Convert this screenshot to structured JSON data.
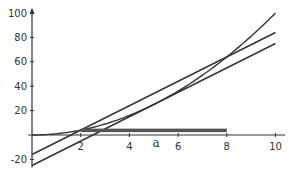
{
  "chart_data": {
    "type": "line",
    "title": "",
    "xlabel": "",
    "ylabel": "",
    "xlim": [
      0,
      10.4
    ],
    "ylim": [
      -25,
      100
    ],
    "grid": false,
    "x_ticks": [
      "2",
      "4",
      "6",
      "8",
      "10"
    ],
    "y_ticks": [
      "100",
      "80",
      "60",
      "40",
      "20",
      "-20"
    ],
    "annotations": [
      {
        "text": "a",
        "x": 5.1,
        "y": -5
      }
    ],
    "series": [
      {
        "name": "curve",
        "x": [
          0,
          1,
          2,
          3,
          4,
          5,
          6,
          7,
          8,
          9,
          10
        ],
        "values": [
          0,
          1,
          4,
          9,
          16,
          25,
          36,
          49,
          64,
          81,
          100
        ]
      },
      {
        "name": "line-upper",
        "x": [
          0,
          10
        ],
        "values": [
          -16,
          84
        ]
      },
      {
        "name": "line-lower",
        "x": [
          0,
          10
        ],
        "values": [
          -25,
          75
        ]
      },
      {
        "name": "bar-segment",
        "x": [
          2,
          8
        ],
        "values": [
          4,
          4
        ]
      }
    ]
  },
  "colors": {
    "line": "#333333",
    "bar": "#555555",
    "axis": "#333333"
  }
}
